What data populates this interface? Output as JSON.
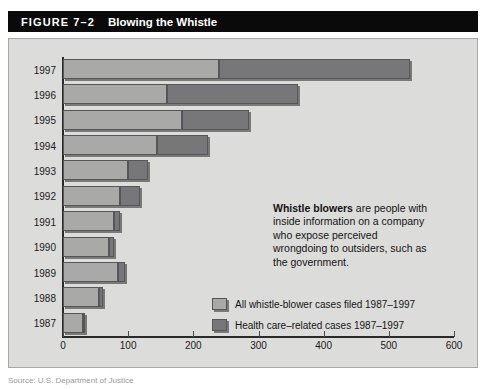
{
  "header": {
    "figure_number": "FIGURE 7–2",
    "title": "Blowing the Whistle"
  },
  "annotation": {
    "lead": "Whistle blowers",
    "body": " are people with inside information on a company who expose perceived wrongdoing to outsiders, such as the government."
  },
  "legend": {
    "items": [
      {
        "label": "All whistle-blower cases filed 1987–1997",
        "color": "#a9a9a7",
        "key": "all_cases"
      },
      {
        "label": "Health care–related cases 1987–1997",
        "color": "#77777a",
        "key": "health_care"
      }
    ]
  },
  "source": {
    "text": "Source: U.S. Department of Justice"
  },
  "colors": {
    "panel_background": "#dcdcda",
    "title_background": "#0a0a0a",
    "title_text": "#ffffff",
    "light_series": "#a9a9a7",
    "dark_series": "#77777a",
    "axis": "#2a2a2a"
  },
  "chart_data": {
    "type": "bar",
    "orientation": "horizontal",
    "stacked": true,
    "title": "Blowing the Whistle",
    "xlabel": "",
    "ylabel": "",
    "xlim": [
      0,
      600
    ],
    "xticks": [
      0,
      100,
      200,
      300,
      400,
      500,
      600
    ],
    "grid": false,
    "legend_position": "inside-lower-right",
    "categories": [
      "1997",
      "1996",
      "1995",
      "1994",
      "1993",
      "1992",
      "1991",
      "1990",
      "1989",
      "1988",
      "1987"
    ],
    "series": [
      {
        "name": "All whistle-blower cases filed 1987–1997",
        "color": "#a9a9a7",
        "values": [
          240,
          160,
          182,
          145,
          100,
          88,
          78,
          70,
          85,
          55,
          30
        ]
      },
      {
        "name": "Health care–related cases 1987–1997",
        "color": "#77777a",
        "values": [
          293,
          200,
          103,
          77,
          30,
          30,
          10,
          8,
          10,
          7,
          3
        ]
      }
    ],
    "totals": [
      533,
      360,
      285,
      222,
      130,
      118,
      88,
      78,
      95,
      62,
      33
    ],
    "annotation": "Whistle blowers are people with inside information on a company who expose perceived wrongdoing to outsiders, such as the government."
  }
}
